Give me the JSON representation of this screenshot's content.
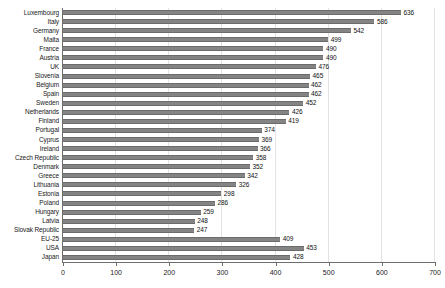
{
  "chart_data": {
    "type": "bar",
    "orientation": "horizontal",
    "title": "",
    "subtitle": "",
    "xlabel": "",
    "ylabel": "",
    "xlim": [
      0,
      700
    ],
    "xticks": [
      0,
      100,
      200,
      300,
      400,
      500,
      600,
      700
    ],
    "grid": true,
    "legend": false,
    "bar_color": "#848484",
    "categories": [
      "Luxembourg",
      "Italy",
      "Germany",
      "Malta",
      "France",
      "Austria",
      "UK",
      "Slovenia",
      "Belgium",
      "Spain",
      "Sweden",
      "Netherlands",
      "Finland",
      "Portugal",
      "Cyprus",
      "Ireland",
      "Czech Republic",
      "Denmark",
      "Greece",
      "Lithuania",
      "Estonia",
      "Poland",
      "Hungary",
      "Latvia",
      "Slovak Republic",
      "EU-25",
      "USA",
      "Japan"
    ],
    "values": [
      636,
      586,
      542,
      499,
      490,
      490,
      476,
      465,
      462,
      462,
      452,
      426,
      419,
      374,
      369,
      366,
      358,
      352,
      342,
      326,
      298,
      286,
      259,
      248,
      247,
      409,
      453,
      428
    ],
    "data_labels": [
      "636",
      "586",
      "542",
      "499",
      "490",
      "490",
      "476",
      "465",
      "462",
      "462",
      "452",
      "426",
      "419",
      "374",
      "369",
      "366",
      "358",
      "352",
      "342",
      "326",
      "298",
      "286",
      "259",
      "248",
      "247",
      "409",
      "453",
      "428"
    ],
    "xtick_labels": [
      "0",
      "100",
      "200",
      "300",
      "400",
      "500",
      "600",
      "700"
    ]
  }
}
